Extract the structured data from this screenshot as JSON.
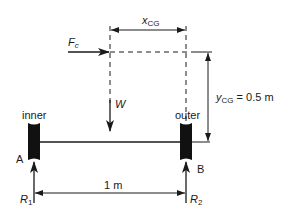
{
  "diagram": {
    "type": "free-body-diagram",
    "supports": {
      "inner": {
        "label": "inner",
        "point": "A"
      },
      "outer": {
        "label": "outer",
        "point": "B"
      }
    },
    "forces": {
      "fc": {
        "symbol": "F",
        "sub": "c"
      },
      "w": {
        "symbol": "W"
      },
      "r1": {
        "symbol": "R",
        "sub": "1"
      },
      "r2": {
        "symbol": "R",
        "sub": "2"
      }
    },
    "dimensions": {
      "xcg": {
        "symbol": "x",
        "sub": "CG"
      },
      "ycg": {
        "symbol": "y",
        "sub": "CG",
        "value": " = 0.5 m"
      },
      "span": {
        "label": "1 m"
      }
    },
    "colors": {
      "ink": "#1a1a1a",
      "background": "#ffffff"
    }
  }
}
